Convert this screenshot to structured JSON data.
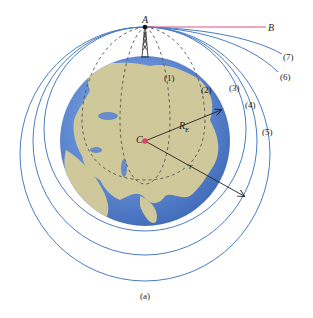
{
  "figure": {
    "caption": "(a)",
    "labels": {
      "point_a": "A",
      "point_b": "B",
      "center": "C",
      "earth_radius": "R",
      "earth_radius_sub": "E",
      "orbit_radius": "r"
    },
    "trajectories": [
      {
        "id": "1",
        "label": "(1)",
        "style": "dashed",
        "type": "ellipse-inside-earth"
      },
      {
        "id": "2",
        "label": "(2)",
        "style": "dashed",
        "type": "ellipse-inside-earth"
      },
      {
        "id": "3",
        "label": "(3)",
        "style": "solid",
        "type": "circular-orbit"
      },
      {
        "id": "4",
        "label": "(4)",
        "style": "solid",
        "type": "elliptical-orbit"
      },
      {
        "id": "5",
        "label": "(5)",
        "style": "solid",
        "type": "elliptical-orbit"
      },
      {
        "id": "6",
        "label": "(6)",
        "style": "solid",
        "type": "escape"
      },
      {
        "id": "7",
        "label": "(7)",
        "style": "solid",
        "type": "escape"
      }
    ],
    "colors": {
      "orbit_line": "#4a7cc4",
      "dashed_line": "#555555",
      "line_ab": "#e0507a",
      "center_dot": "#e0406a",
      "ocean": "#5b86cf",
      "land": "#cfc89a",
      "arrow": "#222222"
    }
  }
}
